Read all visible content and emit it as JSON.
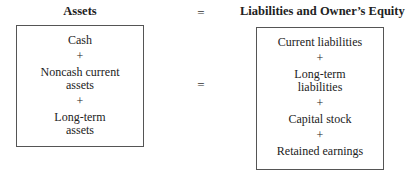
{
  "left": {
    "heading": "Assets",
    "items": [
      "Cash",
      "Noncash current assets",
      "Long-term assets"
    ],
    "lines": [
      [
        "Cash"
      ],
      [
        "Noncash current",
        "assets"
      ],
      [
        "Long-term",
        "assets"
      ]
    ]
  },
  "operator": "=",
  "plus": "+",
  "right": {
    "heading": "Liabilities and Owner’s Equity",
    "items": [
      "Current liabilities",
      "Long-term liabilities",
      "Capital stock",
      "Retained earnings"
    ],
    "lines": [
      [
        "Current liabilities"
      ],
      [
        "Long-term",
        "liabilities"
      ],
      [
        "Capital stock"
      ],
      [
        "Retained earnings"
      ]
    ]
  }
}
